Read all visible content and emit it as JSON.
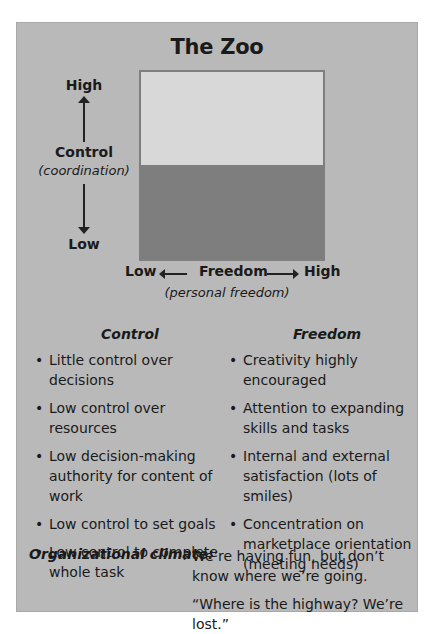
{
  "diagram": {
    "title": "The Zoo",
    "y_axis": {
      "high": "High",
      "label": "Control",
      "sublabel": "(coordination)",
      "low": "Low"
    },
    "x_axis": {
      "low": "Low",
      "label": "Freedom",
      "sublabel": "(personal freedom)",
      "high": "High"
    },
    "box_colors": {
      "top": "#d8d8d8",
      "bottom": "#7e7e7e"
    },
    "panel_color": "#b9b9b9"
  },
  "columns": {
    "control": {
      "heading": "Control",
      "items": [
        "Little control over decisions",
        "Low control over resources",
        "Low decision-making authority for content of work",
        "Low control to set goals",
        "Low control to complete whole task"
      ]
    },
    "freedom": {
      "heading": "Freedom",
      "items": [
        "Creativity highly encouraged",
        "Attention to expanding skills and tasks",
        "Internal and external satisfaction (lots of smiles)",
        "Concentration on marketplace orientation (meeting needs)"
      ]
    }
  },
  "climate": {
    "label": "Organizational climate:",
    "lines": [
      "We’re having fun, but don’t know where we’re going.",
      "“Where is the highway? We’re lost.”"
    ]
  }
}
